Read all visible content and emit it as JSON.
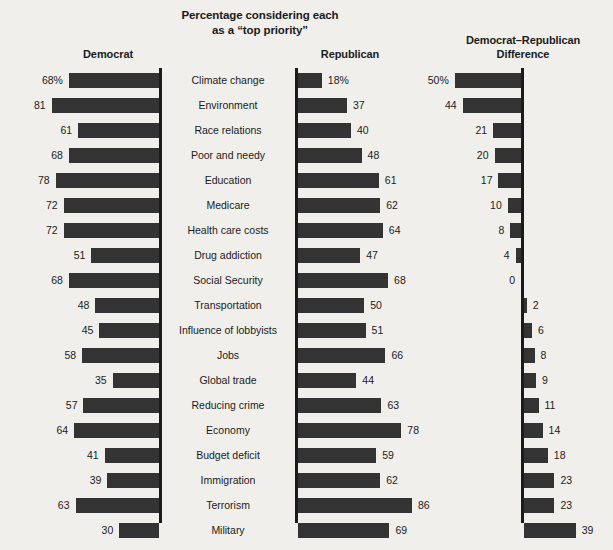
{
  "title": {
    "line1": "Percentage considering each",
    "line2": "as a “top priority”"
  },
  "headers": {
    "democrat": "Democrat",
    "republican": "Republican",
    "difference_line1": "Democrat–Republican",
    "difference_line2": "Difference"
  },
  "style": {
    "bar_color": "#333333",
    "background": "#f0efec",
    "axis_color": "#1b1b1b"
  },
  "chart_data": {
    "type": "bar",
    "title": "Percentage considering each as a “top priority”",
    "xlabel": "",
    "ylabel": "",
    "grid": false,
    "legend_position": "none",
    "orientation": "horizontal",
    "panels": [
      "Democrat",
      "Republican",
      "Democrat–Republican Difference"
    ],
    "categories": [
      "Climate change",
      "Environment",
      "Race relations",
      "Poor and needy",
      "Education",
      "Medicare",
      "Health care costs",
      "Drug addiction",
      "Social Security",
      "Transportation",
      "Influence of lobbyists",
      "Jobs",
      "Global trade",
      "Reducing crime",
      "Economy",
      "Budget deficit",
      "Immigration",
      "Terrorism",
      "Military"
    ],
    "series": [
      {
        "name": "Democrat",
        "values": [
          68,
          81,
          61,
          68,
          78,
          72,
          72,
          51,
          68,
          48,
          45,
          58,
          35,
          57,
          64,
          41,
          39,
          63,
          30
        ],
        "labels": [
          "68%",
          "81",
          "61",
          "68",
          "78",
          "72",
          "72",
          "51",
          "68",
          "48",
          "45",
          "58",
          "35",
          "57",
          "64",
          "41",
          "39",
          "63",
          "30"
        ]
      },
      {
        "name": "Republican",
        "values": [
          18,
          37,
          40,
          48,
          61,
          62,
          64,
          47,
          68,
          50,
          51,
          66,
          44,
          63,
          78,
          59,
          62,
          86,
          69
        ],
        "labels": [
          "18%",
          "37",
          "40",
          "48",
          "61",
          "62",
          "64",
          "47",
          "68",
          "50",
          "51",
          "66",
          "44",
          "63",
          "78",
          "59",
          "62",
          "86",
          "69"
        ]
      },
      {
        "name": "Democrat–Republican Difference",
        "values": [
          50,
          44,
          21,
          20,
          17,
          10,
          8,
          4,
          0,
          -2,
          -6,
          -8,
          -9,
          -11,
          -14,
          -18,
          -23,
          -23,
          -39
        ],
        "labels": [
          "50%",
          "44",
          "21",
          "20",
          "17",
          "10",
          "8",
          "4",
          "0",
          "2",
          "6",
          "8",
          "9",
          "11",
          "14",
          "18",
          "23",
          "23",
          "39"
        ]
      }
    ],
    "xlim": [
      0,
      100
    ]
  }
}
